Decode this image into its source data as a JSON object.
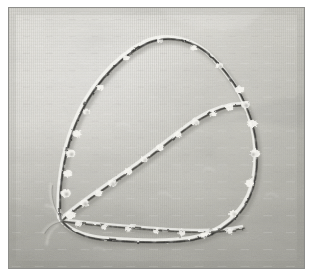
{
  "image": {
    "kind": "photograph",
    "subject": "embroidered-leaf-outline-on-linen",
    "title": "Embroidered leaf outline stitched on woven linen",
    "description": "Close-up photograph of hand stitching on a pale woven linen ground. A dark thread traces a large leaf-shaped outline: a tall rounded outer arc sweeping from a pointed tip at the lower left up and over to the right, down the right side and back along a nearly straight lower edge; a second stitched line runs diagonally from the same lower-left tip up to the right shoulder, forming the leaf's central vein and dividing the shape into two lobes. Small pale knots and loose thread ends catch the light along both stitch lines.",
    "orientation": "landscape",
    "frame": {
      "mat_color": "#ffffff",
      "rule_color": "#8d8d8a",
      "mat_top": 7,
      "mat_right": 9,
      "mat_bottom": 8,
      "mat_left": 8
    },
    "palette": {
      "fabric_light": "#dedcd5",
      "fabric_mid": "#cfcdc5",
      "fabric_shadow": "#b4b3ac",
      "fabric_deep_shadow": "#a3a29c",
      "weave_line": "#c2c0b8",
      "thread_dark": "#2f2f2d",
      "thread_mid": "#5b5a55",
      "thread_highlight": "#f6f5f0",
      "knot_highlight": "#ffffff"
    },
    "lighting": {
      "direction": "from upper left",
      "note": "broad soft highlight across the upper left of the cloth; a diagonal tonal step darkens the right side below mid-height and the lower-left corner"
    },
    "texture": {
      "name": "plain-weave linen",
      "dominant_direction": "vertical warp threads with faint horizontal weft",
      "warp_spacing_px": 2,
      "weft_spacing_px": 3
    },
    "stitching": {
      "technique": "running / back stitch outline with loose knotted ends",
      "thread_color_name": "dark grey-brown",
      "lines": [
        {
          "id": "outer-arc",
          "label": "outer leaf contour",
          "knot_count": 16
        },
        {
          "id": "central-vein",
          "label": "central vein stitch line",
          "knot_count": 12
        },
        {
          "id": "lower-edge",
          "label": "lower straight edge",
          "knot_count": 7
        }
      ]
    }
  }
}
